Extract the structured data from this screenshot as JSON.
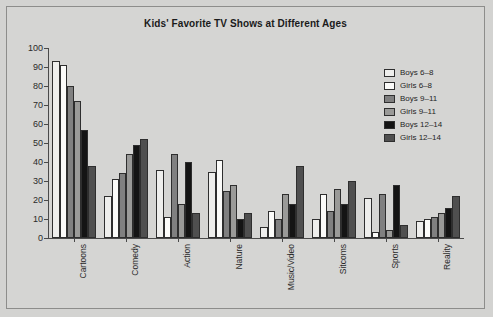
{
  "chart_data": {
    "type": "bar",
    "title": "Kids' Favorite TV Shows at Different Ages",
    "xlabel": "",
    "ylabel": "",
    "ylim": [
      0,
      100
    ],
    "yticks": [
      0,
      10,
      20,
      30,
      40,
      50,
      60,
      70,
      80,
      90,
      100
    ],
    "grid": false,
    "legend_position": "top-right",
    "categories": [
      "Cartoons",
      "Comedy",
      "Action",
      "Nature",
      "Music/Video",
      "Sitcoms",
      "Sports",
      "Reality"
    ],
    "series": [
      {
        "name": "Boys 6–8",
        "color": "#eeeeec",
        "values": [
          93,
          22,
          36,
          35,
          6,
          10,
          21,
          9
        ]
      },
      {
        "name": "Girls 6–8",
        "color": "#fbfbf9",
        "values": [
          91,
          31,
          11,
          41,
          14,
          23,
          3,
          10
        ]
      },
      {
        "name": "Boys 9–11",
        "color": "#808080",
        "values": [
          80,
          34,
          44,
          25,
          10,
          14,
          23,
          11
        ]
      },
      {
        "name": "Girls 9–11",
        "color": "#9a9a98",
        "values": [
          72,
          44,
          18,
          28,
          23,
          26,
          4,
          13
        ]
      },
      {
        "name": "Boys 12–14",
        "color": "#141414",
        "values": [
          57,
          49,
          40,
          10,
          18,
          18,
          28,
          16
        ]
      },
      {
        "name": "Girls 12–14",
        "color": "#4f4f4f",
        "values": [
          38,
          52,
          13,
          13,
          38,
          30,
          7,
          22
        ]
      }
    ]
  },
  "legend": {
    "items": [
      {
        "label": "Boys 6–8"
      },
      {
        "label": "Girls 6–8"
      },
      {
        "label": "Boys 9–11"
      },
      {
        "label": "Girls 9–11"
      },
      {
        "label": "Boys 12–14"
      },
      {
        "label": "Girls 12–14"
      }
    ]
  }
}
